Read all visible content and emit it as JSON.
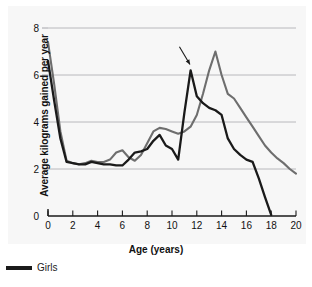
{
  "chart_data": {
    "type": "line",
    "title": "",
    "xlabel": "Age (years)",
    "ylabel": "Average kilograms gained per year",
    "xlim": [
      0,
      20
    ],
    "ylim": [
      0,
      8
    ],
    "xticks": [
      0,
      2,
      4,
      6,
      8,
      10,
      12,
      14,
      16,
      18,
      20
    ],
    "yticks": [
      0,
      2,
      4,
      6,
      8
    ],
    "grid": "horizontal",
    "legend_position": "below-left",
    "series": [
      {
        "name": "Girls",
        "color": "#1a1a1a",
        "x": [
          0,
          0.5,
          1,
          1.5,
          2,
          2.5,
          3,
          3.5,
          4,
          4.5,
          5,
          5.5,
          6,
          6.5,
          7,
          7.5,
          8,
          8.5,
          9,
          9.5,
          10,
          10.5,
          11,
          11.5,
          12,
          12.5,
          13,
          13.5,
          14,
          14.5,
          15,
          15.5,
          16,
          16.5,
          17,
          17.5,
          18
        ],
        "y": [
          6.6,
          4.9,
          3.3,
          2.3,
          2.25,
          2.2,
          2.2,
          2.3,
          2.25,
          2.2,
          2.2,
          2.15,
          2.15,
          2.4,
          2.7,
          2.75,
          2.85,
          3.2,
          3.45,
          3.0,
          2.85,
          2.4,
          4.4,
          6.2,
          5.1,
          4.8,
          4.6,
          4.5,
          4.3,
          3.3,
          2.85,
          2.6,
          2.4,
          2.3,
          1.6,
          0.8,
          0.05
        ]
      },
      {
        "name": "Boys",
        "color": "#6e6e6e",
        "x": [
          0,
          0.5,
          1,
          1.5,
          2,
          2.5,
          3,
          3.5,
          4,
          4.5,
          5,
          5.5,
          6,
          6.5,
          7,
          7.5,
          8,
          8.5,
          9,
          9.5,
          10,
          10.5,
          11,
          11.5,
          12,
          12.5,
          13,
          13.5,
          14,
          14.5,
          15,
          15.5,
          16,
          16.5,
          17,
          17.5,
          18,
          18.5,
          19,
          19.5,
          20
        ],
        "y": [
          7.4,
          5.6,
          3.6,
          2.35,
          2.25,
          2.2,
          2.25,
          2.35,
          2.3,
          2.3,
          2.4,
          2.7,
          2.8,
          2.5,
          2.35,
          2.6,
          3.1,
          3.6,
          3.75,
          3.7,
          3.6,
          3.5,
          3.6,
          3.8,
          4.3,
          5.2,
          6.2,
          7.0,
          6.0,
          5.2,
          5.0,
          4.6,
          4.2,
          3.8,
          3.4,
          3.0,
          2.7,
          2.45,
          2.25,
          2.0,
          1.8
        ]
      }
    ],
    "annotations": [
      {
        "name": "peak-arrow",
        "type": "arrow",
        "points_to_series": "Girls",
        "from": {
          "x": 10.6,
          "y": 7.2
        },
        "to": {
          "x": 11.45,
          "y": 6.45
        }
      }
    ]
  },
  "axes": {
    "y_title": "Average kilograms gained per year",
    "x_title": "Age (years)",
    "x_tick_labels": [
      "0",
      "2",
      "4",
      "6",
      "8",
      "10",
      "12",
      "14",
      "16",
      "18",
      "20"
    ],
    "y_tick_labels": [
      "0",
      "2",
      "4",
      "6",
      "8"
    ]
  },
  "legend": {
    "items": [
      {
        "label": "Girls",
        "color": "#1a1a1a"
      }
    ]
  },
  "colors": {
    "background": "#ffffff",
    "plot_background": "#f7f7f7",
    "grid": "#9a9aa0",
    "axis": "#1a1a1a",
    "girls": "#1a1a1a",
    "boys": "#6e6e6e"
  }
}
